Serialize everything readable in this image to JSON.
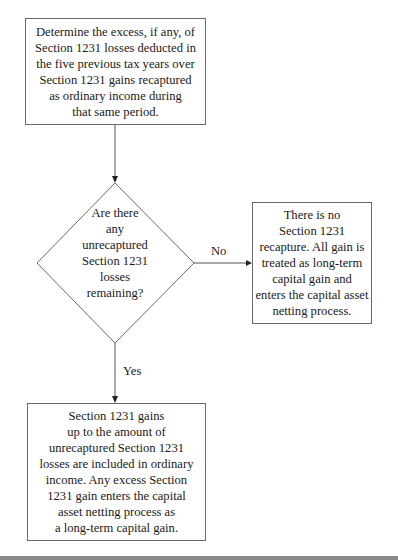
{
  "flowchart": {
    "start_box": {
      "lines": [
        "Determine the excess, if any, of",
        "Section 1231 losses deducted in",
        "the five previous tax years over",
        "Section 1231 gains recaptured",
        "as ordinary income during",
        "that same period."
      ]
    },
    "decision": {
      "lines": [
        "Are there",
        "any",
        "unrecaptured",
        "Section 1231",
        "losses",
        "remaining?"
      ]
    },
    "no_branch": {
      "label": "No",
      "box_lines": [
        "There is no",
        "Section 1231",
        "recapture. All gain is",
        "treated as long-term",
        "capital gain and",
        "enters the capital asset",
        "netting process."
      ]
    },
    "yes_branch": {
      "label": "Yes",
      "box_lines": [
        "Section 1231 gains",
        "up to the amount of",
        "unrecaptured Section 1231",
        "losses are included in ordinary",
        "income. Any excess Section",
        "1231 gain enters the capital",
        "asset netting process as",
        "a long-term capital gain."
      ]
    }
  },
  "colors": {
    "border": "#6a6a6a",
    "text": "#1a1a1a",
    "background": "#ffffff",
    "bottom_band": "#8a8a8a"
  }
}
